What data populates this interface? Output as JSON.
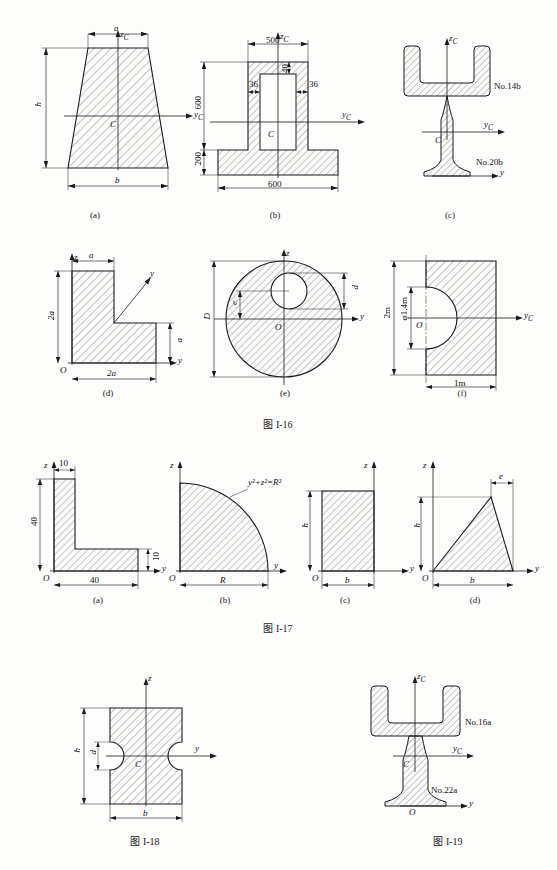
{
  "page": {
    "background": "#fdfdfc",
    "ink": "#1a1a1a",
    "hatch_color": "#555555"
  },
  "figures": [
    {
      "id": "fig-I-16",
      "caption": "图 I-16",
      "subfigures": [
        {
          "key": "a",
          "sublabel": "(a)",
          "shape": "trapezoid",
          "labels": [
            {
              "name": "axis-z-label",
              "text": "z",
              "sub": "C"
            },
            {
              "name": "axis-y-label",
              "text": "y",
              "sub": "C"
            },
            {
              "name": "centroid-label",
              "text": "C"
            },
            {
              "name": "dim-top-width",
              "text": "a"
            },
            {
              "name": "dim-bottom-width",
              "text": "b"
            },
            {
              "name": "dim-height",
              "text": "h"
            }
          ]
        },
        {
          "key": "b",
          "sublabel": "(b)",
          "shape": "hollow-tee-section",
          "labels": [
            {
              "name": "axis-z-label",
              "text": "z",
              "sub": "C"
            },
            {
              "name": "axis-y-label",
              "text": "y",
              "sub": "C"
            },
            {
              "name": "centroid-label",
              "text": "C"
            },
            {
              "name": "dim-top-width",
              "text": "500"
            },
            {
              "name": "dim-web-height",
              "text": "600"
            },
            {
              "name": "dim-flange-height",
              "text": "200"
            },
            {
              "name": "dim-base-width",
              "text": "600"
            },
            {
              "name": "dim-top-thickness",
              "text": "40"
            },
            {
              "name": "dim-wall-left",
              "text": "36"
            },
            {
              "name": "dim-wall-right",
              "text": "36"
            }
          ]
        },
        {
          "key": "c",
          "sublabel": "(c)",
          "shape": "channel-on-ibeam",
          "labels": [
            {
              "name": "axis-z-label",
              "text": "z",
              "sub": "C"
            },
            {
              "name": "axis-yc-label",
              "text": "y",
              "sub": "C"
            },
            {
              "name": "axis-y-label",
              "text": "y"
            },
            {
              "name": "centroid-label",
              "text": "C"
            },
            {
              "name": "channel-spec",
              "text": "No.14b"
            },
            {
              "name": "ibeam-spec",
              "text": "No.20b"
            }
          ]
        },
        {
          "key": "d",
          "sublabel": "(d)",
          "shape": "L-shape",
          "labels": [
            {
              "name": "axis-z-label",
              "text": "z"
            },
            {
              "name": "axis-y-upper-label",
              "text": "y"
            },
            {
              "name": "axis-y-lower-label",
              "text": "y"
            },
            {
              "name": "origin-label",
              "text": "O"
            },
            {
              "name": "dim-top-width",
              "text": "a"
            },
            {
              "name": "dim-left-height",
              "text": "2a"
            },
            {
              "name": "dim-right-height",
              "text": "a"
            },
            {
              "name": "dim-bottom-width",
              "text": "2a"
            }
          ]
        },
        {
          "key": "e",
          "sublabel": "(e)",
          "shape": "circle-with-eccentric-hole",
          "labels": [
            {
              "name": "axis-z-label",
              "text": "z"
            },
            {
              "name": "axis-y-label",
              "text": "y"
            },
            {
              "name": "origin-label",
              "text": "O"
            },
            {
              "name": "dim-outer-diameter",
              "text": "D"
            },
            {
              "name": "dim-hole-diameter",
              "text": "d"
            },
            {
              "name": "dim-eccentricity",
              "text": "e"
            }
          ]
        },
        {
          "key": "f",
          "sublabel": "(f)",
          "shape": "rect-with-semicircular-notch",
          "labels": [
            {
              "name": "axis-yc-label",
              "text": "y",
              "sub": "C"
            },
            {
              "name": "origin-label",
              "text": "O"
            },
            {
              "name": "dim-height",
              "text": "2m"
            },
            {
              "name": "dim-hole-diameter",
              "text": "φ1.4m"
            },
            {
              "name": "dim-width",
              "text": "1m"
            }
          ]
        }
      ]
    },
    {
      "id": "fig-I-17",
      "caption": "图 I-17",
      "subfigures": [
        {
          "key": "a",
          "sublabel": "(a)",
          "shape": "angle-section",
          "labels": [
            {
              "name": "axis-z-label",
              "text": "z"
            },
            {
              "name": "axis-y-label",
              "text": "y"
            },
            {
              "name": "origin-label",
              "text": "O"
            },
            {
              "name": "dim-flange-thickness",
              "text": "10"
            },
            {
              "name": "dim-vertical-leg",
              "text": "40"
            },
            {
              "name": "dim-web-thickness",
              "text": "10"
            },
            {
              "name": "dim-horizontal-leg",
              "text": "40"
            }
          ]
        },
        {
          "key": "b",
          "sublabel": "(b)",
          "shape": "quarter-circle",
          "labels": [
            {
              "name": "axis-z-label",
              "text": "z"
            },
            {
              "name": "axis-y-label",
              "text": "y"
            },
            {
              "name": "origin-label",
              "text": "O"
            },
            {
              "name": "curve-equation",
              "text": "y²+z²=R²"
            },
            {
              "name": "dim-radius",
              "text": "R"
            }
          ]
        },
        {
          "key": "c",
          "sublabel": "(c)",
          "shape": "rectangle",
          "labels": [
            {
              "name": "axis-z-label",
              "text": "z"
            },
            {
              "name": "axis-y-label",
              "text": "y"
            },
            {
              "name": "origin-label",
              "text": "O"
            },
            {
              "name": "dim-height",
              "text": "h"
            },
            {
              "name": "dim-width",
              "text": "b"
            }
          ]
        },
        {
          "key": "d",
          "sublabel": "(d)",
          "shape": "triangle",
          "labels": [
            {
              "name": "axis-z-label",
              "text": "z"
            },
            {
              "name": "axis-y-label",
              "text": "y"
            },
            {
              "name": "origin-label",
              "text": "O"
            },
            {
              "name": "dim-height",
              "text": "h"
            },
            {
              "name": "dim-apex-offset",
              "text": "e"
            },
            {
              "name": "dim-base",
              "text": "b"
            }
          ]
        }
      ]
    },
    {
      "id": "fig-I-18",
      "caption": "图 I-18",
      "shape": "rect-with-two-side-notches",
      "labels": [
        {
          "name": "axis-z-label",
          "text": "z"
        },
        {
          "name": "axis-y-label",
          "text": "y"
        },
        {
          "name": "centroid-label",
          "text": "C"
        },
        {
          "name": "dim-height",
          "text": "h"
        },
        {
          "name": "dim-notch-diameter",
          "text": "d"
        },
        {
          "name": "dim-width",
          "text": "b"
        }
      ]
    },
    {
      "id": "fig-I-19",
      "caption": "图 I-19",
      "shape": "channel-on-ibeam",
      "labels": [
        {
          "name": "axis-z-label",
          "text": "z",
          "sub": "C"
        },
        {
          "name": "axis-yc-label",
          "text": "y",
          "sub": "C"
        },
        {
          "name": "axis-y-label",
          "text": "y"
        },
        {
          "name": "centroid-label",
          "text": "C"
        },
        {
          "name": "origin-label",
          "text": "O"
        },
        {
          "name": "channel-spec",
          "text": "No.16a"
        },
        {
          "name": "ibeam-spec",
          "text": "No.22a"
        }
      ]
    }
  ]
}
